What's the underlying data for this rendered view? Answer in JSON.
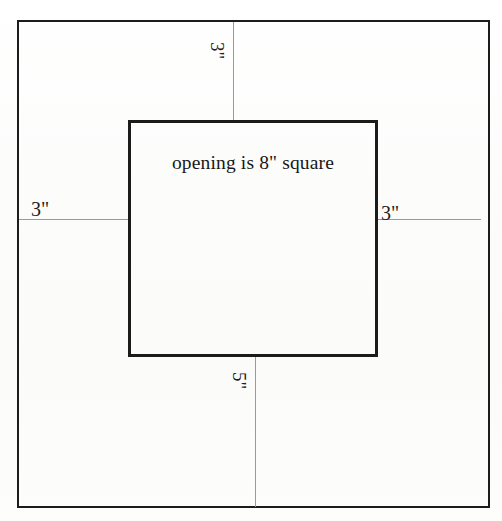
{
  "diagram": {
    "background_color": "#fdfdfc",
    "line_color": "#1c1c1c",
    "leader_color": "#9a9a9a",
    "outer_shape": {
      "name": "outer-rectangle",
      "border_px": 2
    },
    "inner_shape": {
      "name": "inner-square",
      "border_px": 3,
      "caption": "opening is 8\" square"
    },
    "dimensions": [
      {
        "position": "top",
        "value": "3\"",
        "orientation": "rotated-90"
      },
      {
        "position": "left",
        "value": "3\"",
        "orientation": "horizontal"
      },
      {
        "position": "right",
        "value": "3\"",
        "orientation": "horizontal"
      },
      {
        "position": "bottom",
        "value": "5\"",
        "orientation": "rotated-90"
      }
    ]
  },
  "chart_data": {
    "type": "diagram",
    "annotations": [
      {
        "label": "3\"",
        "location": "top margin"
      },
      {
        "label": "3\"",
        "location": "left margin"
      },
      {
        "label": "3\"",
        "location": "right margin"
      },
      {
        "label": "5\"",
        "location": "bottom margin"
      },
      {
        "label": "opening is 8\" square",
        "location": "inside opening"
      }
    ],
    "shapes": [
      {
        "kind": "rectangle",
        "role": "board outline"
      },
      {
        "kind": "square",
        "role": "opening",
        "size_label": "8\""
      }
    ]
  }
}
